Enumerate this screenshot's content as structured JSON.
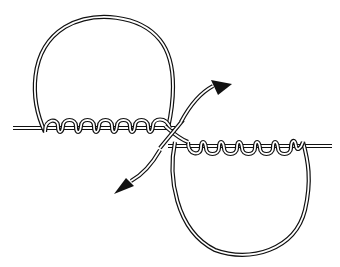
{
  "diagram": {
    "subject": "knot-tying diagram: two loops with wrapped turns around a standing line",
    "background": "#ffffff",
    "stroke_color": "#111111",
    "elements": [
      {
        "name": "horizontal-line-left",
        "description": "double rope line entering from left"
      },
      {
        "name": "upper-loop",
        "description": "large loop above, left side"
      },
      {
        "name": "left-wraps",
        "count": 7,
        "description": "coil turns around left line"
      },
      {
        "name": "crossing",
        "description": "ropes cross at center"
      },
      {
        "name": "right-wraps",
        "count": 7,
        "description": "coil turns around right line"
      },
      {
        "name": "lower-loop",
        "description": "large loop below, right side"
      },
      {
        "name": "horizontal-line-right",
        "description": "double rope line exiting right"
      },
      {
        "name": "arrow-up-right",
        "description": "curved arrow pointing up-right"
      },
      {
        "name": "arrow-down-left",
        "description": "curved arrow pointing down-left"
      }
    ]
  }
}
